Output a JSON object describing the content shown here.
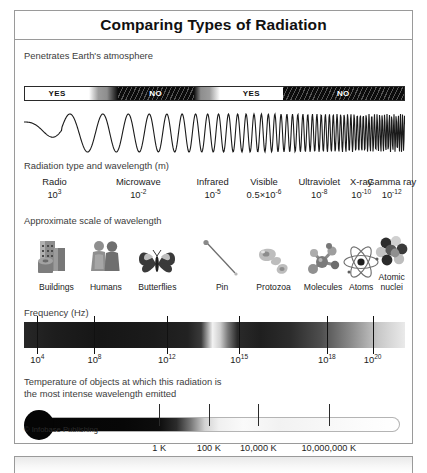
{
  "poster": {
    "title": "Comparing Types of Radiation",
    "credit": "© Infobase Publishing"
  },
  "atmosphere": {
    "heading": "Penetrates Earth's atmosphere",
    "segments": [
      {
        "label": "YES",
        "kind": "yes",
        "width_pct": 17.0
      },
      {
        "label": "",
        "kind": "fade-a",
        "width_pct": 7.5
      },
      {
        "label": "NO",
        "kind": "no",
        "width_pct": 20.0
      },
      {
        "label": "",
        "kind": "fade-b",
        "width_pct": 7.0
      },
      {
        "label": "YES",
        "kind": "yes",
        "width_pct": 16.5
      },
      {
        "label": "NO",
        "kind": "no",
        "width_pct": 32.0
      }
    ]
  },
  "radiation": {
    "heading": "Radiation type and wavelength (m)",
    "types": [
      {
        "name": "Radio",
        "mantissa": "10",
        "exponent": "3",
        "x_pct": 8.0
      },
      {
        "name": "Microwave",
        "mantissa": "10",
        "exponent": "-2",
        "x_pct": 30.0
      },
      {
        "name": "Infrared",
        "mantissa": "10",
        "exponent": "-5",
        "x_pct": 49.5
      },
      {
        "name": "Visible",
        "mantissa": "0.5×10",
        "exponent": "-6",
        "x_pct": 63.0
      },
      {
        "name": "Ultraviolet",
        "mantissa": "10",
        "exponent": "-8",
        "x_pct": 77.5
      },
      {
        "name": "X-ray",
        "mantissa": "10",
        "exponent": "-10",
        "x_pct": 88.5
      },
      {
        "name": "Gamma ray",
        "mantissa": "10",
        "exponent": "-12",
        "x_pct": 96.5
      }
    ]
  },
  "scale": {
    "heading": "Approximate scale of wavelength",
    "objects": [
      {
        "label": "Buildings",
        "icon": "buildings-icon",
        "x_pct": 8.5
      },
      {
        "label": "Humans",
        "icon": "humans-icon",
        "x_pct": 21.5
      },
      {
        "label": "Butterflies",
        "icon": "butterfly-icon",
        "x_pct": 35.0
      },
      {
        "label": "Pin",
        "icon": "pin-icon",
        "x_pct": 52.0
      },
      {
        "label": "Protozoa",
        "icon": "protozoa-icon",
        "x_pct": 65.5
      },
      {
        "label": "Molecules",
        "icon": "molecule-icon",
        "x_pct": 78.5
      },
      {
        "label": "Atoms",
        "icon": "atom-icon",
        "x_pct": 88.5
      },
      {
        "label": "Atomic\nnuclei",
        "icon": "atomic-nucleus-icon",
        "x_pct": 96.5
      }
    ]
  },
  "frequency": {
    "heading": "Frequency (Hz)",
    "ticks": [
      {
        "mantissa": "10",
        "exponent": "4",
        "x_pct": 3.5
      },
      {
        "mantissa": "10",
        "exponent": "8",
        "x_pct": 18.5
      },
      {
        "mantissa": "10",
        "exponent": "12",
        "x_pct": 37.5
      },
      {
        "mantissa": "10",
        "exponent": "15",
        "x_pct": 56.5
      },
      {
        "mantissa": "10",
        "exponent": "18",
        "x_pct": 79.5
      },
      {
        "mantissa": "10",
        "exponent": "20",
        "x_pct": 91.5
      }
    ]
  },
  "temperature": {
    "heading": "Temperature of objects at which this radiation is\nthe most intense wavelength emitted",
    "ticks": [
      {
        "kelvin": "1 K",
        "celsius": "−272°C",
        "x_pct": 35.5
      },
      {
        "kelvin": "100 K",
        "celsius": "−173°C",
        "x_pct": 48.5
      },
      {
        "kelvin": "10,000 K",
        "celsius": "9,727°C",
        "x_pct": 61.5
      },
      {
        "kelvin": "10,000,000 K",
        "celsius": "~10,000,000°C",
        "x_pct": 80.0
      }
    ]
  },
  "chart_data": {
    "type": "diagram",
    "title": "Comparing Types of Radiation",
    "axis": "wavelength decreasing / frequency increasing, left to right",
    "bands": [
      {
        "name": "Radio",
        "wavelength_m": 1000,
        "frequency_hz": 10000.0,
        "penetrates_atmosphere": "YES",
        "scale_object": "Buildings",
        "temperature_k": null
      },
      {
        "name": "Microwave",
        "wavelength_m": 0.01,
        "frequency_hz": 100000000.0,
        "penetrates_atmosphere": "NO",
        "scale_object": "Humans",
        "temperature_k": 1
      },
      {
        "name": "Infrared",
        "wavelength_m": 1e-05,
        "frequency_hz": 1000000000000.0,
        "penetrates_atmosphere": "NO",
        "scale_object": "Pin",
        "temperature_k": 100
      },
      {
        "name": "Visible",
        "wavelength_m": 5e-07,
        "frequency_hz": 1000000000000000.0,
        "penetrates_atmosphere": "YES",
        "scale_object": "Protozoa",
        "temperature_k": 10000
      },
      {
        "name": "Ultraviolet",
        "wavelength_m": 1e-08,
        "frequency_hz": 1e+16,
        "penetrates_atmosphere": "NO",
        "scale_object": "Molecules",
        "temperature_k": null
      },
      {
        "name": "X-ray",
        "wavelength_m": 1e-10,
        "frequency_hz": 1e+18,
        "penetrates_atmosphere": "NO",
        "scale_object": "Atoms",
        "temperature_k": 10000000
      },
      {
        "name": "Gamma ray",
        "wavelength_m": 1e-12,
        "frequency_hz": 1e+20,
        "penetrates_atmosphere": "NO",
        "scale_object": "Atomic nuclei",
        "temperature_k": null
      }
    ],
    "frequency_axis_hz": [
      10000.0,
      100000000.0,
      1000000000000.0,
      1000000000000000.0,
      1e+18,
      1e+20
    ],
    "temperature_axis": [
      {
        "k": 1,
        "c": -272
      },
      {
        "k": 100,
        "c": -173
      },
      {
        "k": 10000,
        "c": 9727
      },
      {
        "k": 10000000,
        "c": -10000000
      }
    ]
  }
}
